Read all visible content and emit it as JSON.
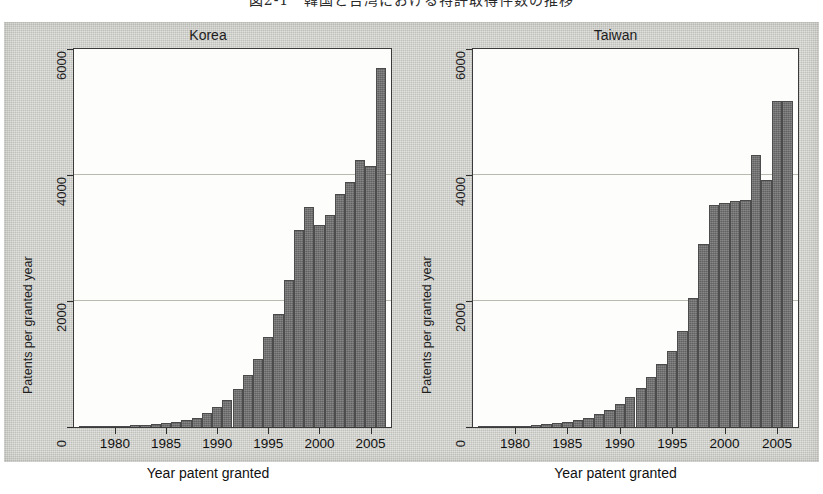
{
  "caption": {
    "text": "図2-1　韓国と台湾における特許取得件数の推移"
  },
  "figure": {
    "background_color": "#cfcfca",
    "plot_background_color": "#fdfdfb",
    "bar_color": "#6e6e6e",
    "bar_border_color": "#4c4c4c",
    "gridline_color": "#b9b9ad",
    "axis_color": "#3b3b3b"
  },
  "chart_data": {
    "type": "bar",
    "title": "図2-1　韓国と台湾における特許取得件数の推移",
    "xlabel": "Year patent granted",
    "ylabel": "Patents per granted year",
    "ylim": [
      0,
      6000
    ],
    "xlim": [
      1976,
      2007
    ],
    "yticks": [
      0,
      2000,
      4000,
      6000
    ],
    "ytick_labels": [
      "0",
      "2000",
      "4000",
      "6000"
    ],
    "xticks": [
      1980,
      1985,
      1990,
      1995,
      2000,
      2005
    ],
    "xtick_labels": [
      "1980",
      "1985",
      "1990",
      "1995",
      "2000",
      "2005"
    ],
    "grid": "horizontal",
    "legend": "none",
    "panels": [
      {
        "name": "Korea",
        "label": "Korea",
        "x": [
          1977,
          1978,
          1979,
          1980,
          1981,
          1982,
          1983,
          1984,
          1985,
          1986,
          1987,
          1988,
          1989,
          1990,
          1991,
          1992,
          1993,
          1994,
          1995,
          1996,
          1997,
          1998,
          1999,
          2000,
          2001,
          2002,
          2003,
          2004,
          2005,
          2006
        ],
        "values": [
          10,
          12,
          15,
          18,
          22,
          28,
          35,
          45,
          60,
          80,
          110,
          150,
          230,
          310,
          430,
          600,
          820,
          1080,
          1430,
          1800,
          2330,
          3130,
          3490,
          3200,
          3360,
          3700,
          3890,
          4240,
          4150,
          5700
        ]
      },
      {
        "name": "Taiwan",
        "label": "Taiwan",
        "x": [
          1977,
          1978,
          1979,
          1980,
          1981,
          1982,
          1983,
          1984,
          1985,
          1986,
          1987,
          1988,
          1989,
          1990,
          1991,
          1992,
          1993,
          1994,
          1995,
          1996,
          1997,
          1998,
          1999,
          2000,
          2001,
          2002,
          2003,
          2004,
          2005,
          2006
        ],
        "values": [
          8,
          10,
          13,
          17,
          22,
          30,
          42,
          58,
          80,
          110,
          150,
          200,
          270,
          360,
          470,
          620,
          790,
          1000,
          1210,
          1520,
          2040,
          2910,
          3520,
          3560,
          3590,
          3610,
          4320,
          3920,
          5180,
          5180
        ]
      }
    ]
  }
}
